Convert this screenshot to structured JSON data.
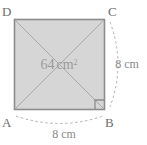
{
  "figure": {
    "name": "square-diagram",
    "shape": "square",
    "vertices": [
      {
        "id": "D",
        "label": "D",
        "position": "top-left"
      },
      {
        "id": "C",
        "label": "C",
        "position": "top-right"
      },
      {
        "id": "A",
        "label": "A",
        "position": "bottom-left"
      },
      {
        "id": "B",
        "label": "B",
        "position": "bottom-right"
      }
    ],
    "area_label": {
      "value": "64",
      "unit": "cm",
      "exponent": "2",
      "full_text": "64 cm²"
    },
    "dimensions": [
      {
        "id": "bottom-side",
        "label": "8 cm",
        "value": "8",
        "unit": "cm",
        "side": "AB"
      },
      {
        "id": "right-side",
        "label": "8 cm",
        "value": "8",
        "unit": "cm",
        "side": "CB"
      }
    ],
    "markers": [
      {
        "id": "right-angle-B",
        "type": "right-angle",
        "at_vertex": "B"
      }
    ],
    "diagonals": [
      {
        "id": "diagonal-DB",
        "from": "D",
        "to": "B"
      },
      {
        "id": "diagonal-AC",
        "from": "A",
        "to": "C"
      }
    ],
    "colors": {
      "fill": "#d6d6d6",
      "stroke": "#8c8c8c",
      "diagonal": "#a6a6a6",
      "dashed_arc": "#b0b0b0",
      "label_text": "#6e6e6e",
      "dimension_text": "#8a8a8a",
      "area_text": "#9a9a9a",
      "background": "#ffffff"
    }
  }
}
